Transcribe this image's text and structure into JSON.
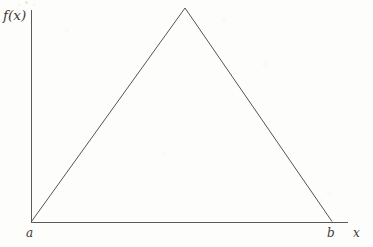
{
  "figure": {
    "caption_visible": false,
    "background_color": "#fdfdfc",
    "line_color": "#55544f",
    "axis_color": "#5a5a58"
  },
  "labels": {
    "y_axis": "f(x)",
    "x_axis": "x",
    "left_endpoint": "a",
    "right_endpoint": "b"
  },
  "chart_data": {
    "type": "line",
    "title": "",
    "subtitle": "",
    "xlabel": "x",
    "ylabel": "f(x)",
    "grid": false,
    "legend": false,
    "legend_position": "none",
    "xtick_labels": [
      "a",
      "b"
    ],
    "ytick_labels": [],
    "xlim": [
      0,
      1
    ],
    "ylim": [
      0,
      1
    ],
    "annotations": [],
    "series": [
      {
        "name": "f(x)",
        "description": "Triangular (tent) function rising linearly from zero at a to a peak, then falling linearly back to zero at b",
        "x": [
          0.0,
          0.512,
          1.0
        ],
        "y": [
          0.0,
          1.0,
          0.0
        ]
      }
    ],
    "pixel_geometry": {
      "origin": [
        31,
        222
      ],
      "apex": [
        185,
        8
      ],
      "right_base": [
        332,
        222
      ],
      "y_axis_top": [
        31,
        10
      ],
      "x_axis_right": [
        348,
        222
      ]
    }
  }
}
